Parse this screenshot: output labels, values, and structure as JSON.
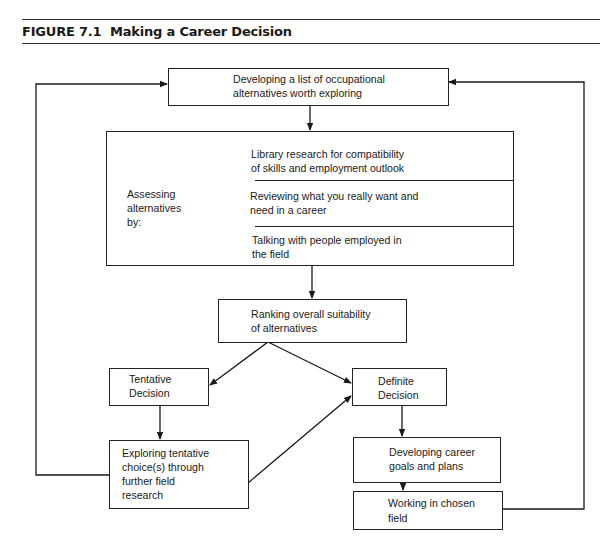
{
  "figure": {
    "label": "FIGURE 7.1",
    "title": "Making a Career Decision"
  },
  "nodes": {
    "develop_list": {
      "lines": [
        "Developing a list of occupational",
        "alternatives worth exploring"
      ]
    },
    "assessing": {
      "label_lines": [
        "Assessing",
        "alternatives",
        "by:"
      ],
      "items": [
        {
          "lines": [
            "Library research for compatibility",
            "of skills and employment outlook"
          ]
        },
        {
          "lines": [
            "Reviewing what you really want and",
            "need in a career"
          ]
        },
        {
          "lines": [
            "Talking with people employed in",
            "the field"
          ]
        }
      ]
    },
    "ranking": {
      "lines": [
        "Ranking overall suitability",
        "of alternatives"
      ]
    },
    "tentative": {
      "lines": [
        "Tentative",
        "Decision"
      ]
    },
    "definite": {
      "lines": [
        "Definite",
        "Decision"
      ]
    },
    "exploring": {
      "lines": [
        "Exploring tentative",
        "choice(s) through",
        "further field",
        "research"
      ]
    },
    "goals": {
      "lines": [
        "Developing career",
        "goals and plans"
      ]
    },
    "working": {
      "lines": [
        "Working in chosen",
        "field"
      ]
    }
  },
  "edges": [
    {
      "from": "develop_list",
      "to": "assessing"
    },
    {
      "from": "assessing",
      "to": "ranking"
    },
    {
      "from": "ranking",
      "to": "tentative"
    },
    {
      "from": "ranking",
      "to": "definite"
    },
    {
      "from": "tentative",
      "to": "exploring"
    },
    {
      "from": "exploring",
      "to": "definite"
    },
    {
      "from": "exploring",
      "to": "develop_list"
    },
    {
      "from": "definite",
      "to": "goals"
    },
    {
      "from": "goals",
      "to": "working"
    },
    {
      "from": "working",
      "to": "develop_list"
    }
  ],
  "colors": {
    "ink": "#1a1a1a",
    "background": "#ffffff"
  }
}
